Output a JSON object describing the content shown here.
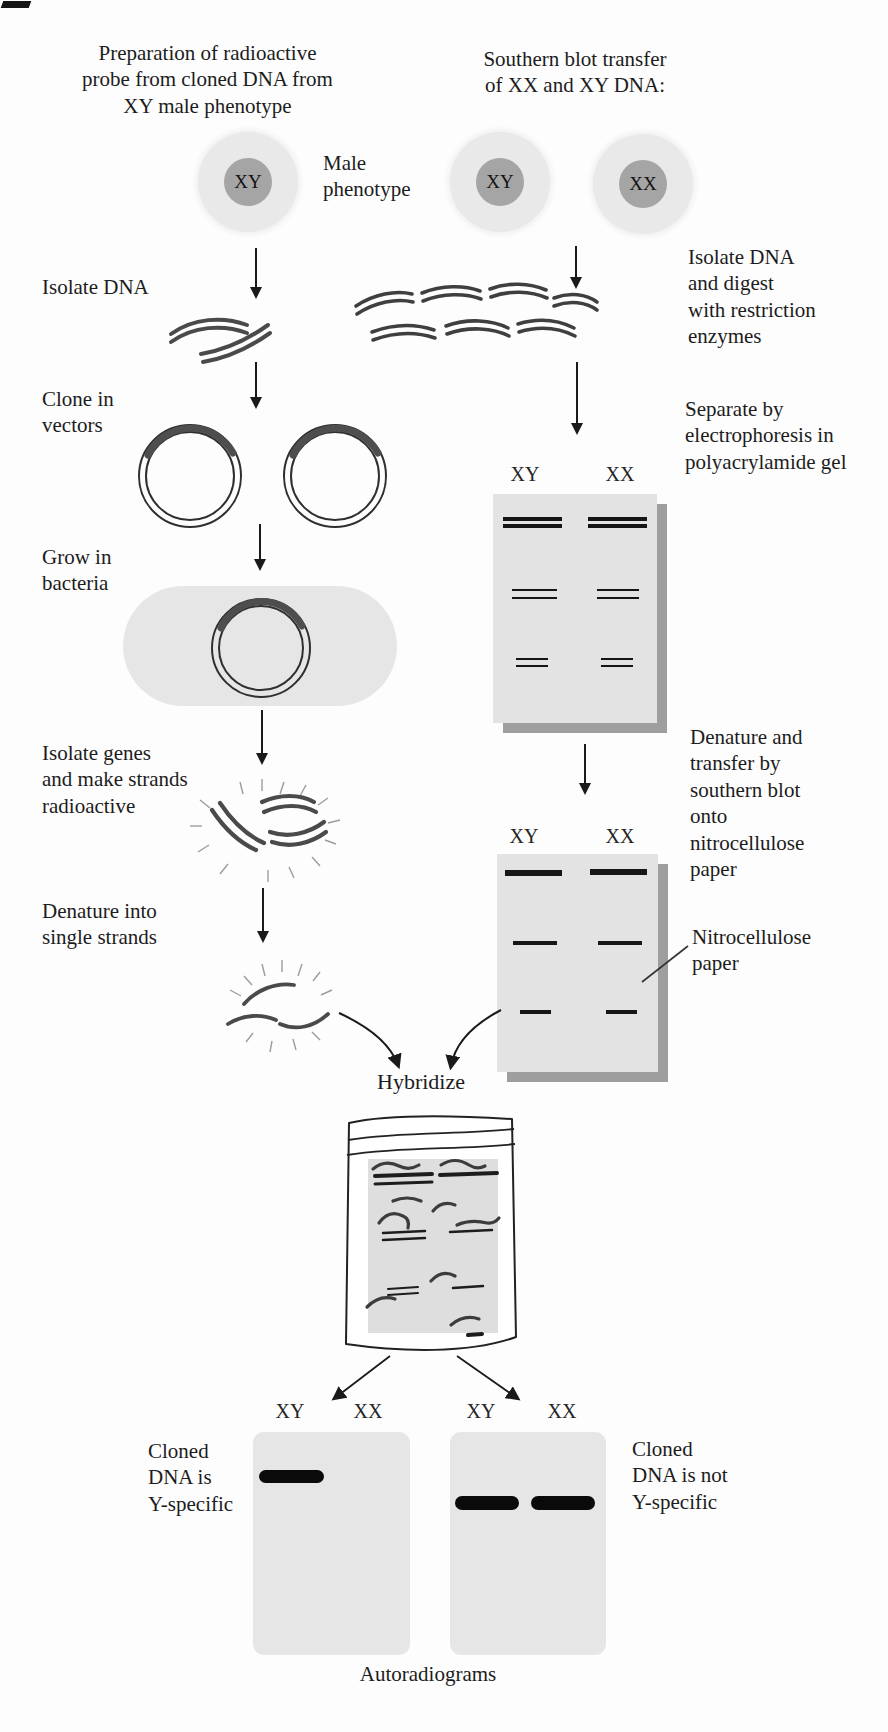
{
  "figure": {
    "left_column": {
      "title": "Preparation of radioactive\nprobe from cloned DNA from\nXY male phenotype",
      "cell_nucleus": "XY",
      "cell_label": "Male\nphenotype",
      "step_isolate_dna": "Isolate DNA",
      "step_clone_in_vectors": "Clone in\nvectors",
      "step_grow_in_bacteria": "Grow in\nbacteria",
      "step_isolate_genes": "Isolate genes\nand make strands\nradioactive",
      "step_denature": "Denature into\nsingle strands"
    },
    "right_column": {
      "title": "Southern blot transfer\nof XX and XY DNA:",
      "cell_nuclei": [
        "XY",
        "XX"
      ],
      "step_isolate_digest": "Isolate DNA\nand digest\nwith restriction\nenzymes",
      "step_separate": "Separate by\nelectrophoresis in\npolyacrylamide gel",
      "step_denature_transfer": "Denature and\ntransfer by\nsouthern blot\nonto\nnitrocellulose\npaper",
      "nitrocellulose_label": "Nitrocellulose\npaper",
      "gel": {
        "lane_labels": [
          "XY",
          "XX"
        ],
        "band_rows": [
          {
            "position": "top",
            "style": "double-thick",
            "lanes": [
              "XY",
              "XX"
            ]
          },
          {
            "position": "middle",
            "style": "double-medium",
            "lanes": [
              "XY",
              "XX"
            ]
          },
          {
            "position": "bottom",
            "style": "double-thin",
            "lanes": [
              "XY",
              "XX"
            ]
          }
        ]
      },
      "blot": {
        "lane_labels": [
          "XY",
          "XX"
        ],
        "band_rows": [
          {
            "position": "top",
            "style": "single-thick",
            "lanes": [
              "XY",
              "XX"
            ]
          },
          {
            "position": "middle",
            "style": "single-medium",
            "lanes": [
              "XY",
              "XX"
            ]
          },
          {
            "position": "bottom",
            "style": "single-thin",
            "lanes": [
              "XY",
              "XX"
            ]
          }
        ]
      }
    },
    "hybridize_label": "Hybridize",
    "autoradiograms": {
      "caption": "Autoradiograms",
      "left": {
        "lane_labels": [
          "XY",
          "XX"
        ],
        "result_label": "Cloned\nDNA is\nY-specific",
        "bands_in_lanes": [
          "XY"
        ]
      },
      "right": {
        "lane_labels": [
          "XY",
          "XX"
        ],
        "result_label": "Cloned\nDNA is not\nY-specific",
        "bands_in_lanes": [
          "XY",
          "XX"
        ]
      }
    },
    "colors": {
      "background": "#fdfdfd",
      "text": "#1c1c1c",
      "strand": "#4a4a4a",
      "gel_fill": "#e3e3e3",
      "gel_shadow": "#9e9e9e",
      "band": "#151515",
      "autoradiogram_fill": "#e6e6e6",
      "autoradiogram_band": "#0a0a0a",
      "cell_cytoplasm": "#e9e9e9",
      "cell_nucleus_fill": "#a5a5a5"
    }
  }
}
